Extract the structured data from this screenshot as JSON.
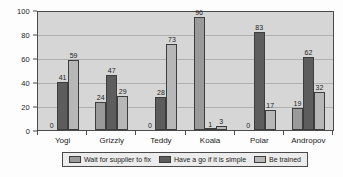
{
  "chart_data": {
    "type": "bar",
    "title": "",
    "subtitle": "",
    "xlabel": "",
    "ylabel": "",
    "ylim": [
      0,
      100
    ],
    "yticks": [
      0,
      20,
      40,
      60,
      80,
      100
    ],
    "grid": true,
    "legend_position": "bottom",
    "categories": [
      "Yogi",
      "Grizzly",
      "Teddy",
      "Koala",
      "Polar",
      "Andropov"
    ],
    "series": [
      {
        "name": "Wait for supplier to fix",
        "color": "#9a9a9a",
        "values": [
          0,
          24,
          0,
          96,
          0,
          19
        ]
      },
      {
        "name": "Have a go if it is simple",
        "color": "#5d5d5d",
        "values": [
          41,
          47,
          28,
          1,
          83,
          62
        ]
      },
      {
        "name": "Be trained",
        "color": "#b7b7b7",
        "values": [
          59,
          29,
          73,
          3,
          17,
          32
        ]
      }
    ]
  },
  "plot": {
    "background_color": "#d6d6d6",
    "border_color": "#4a4a4a",
    "gridline_color": "#b0b0b0"
  }
}
